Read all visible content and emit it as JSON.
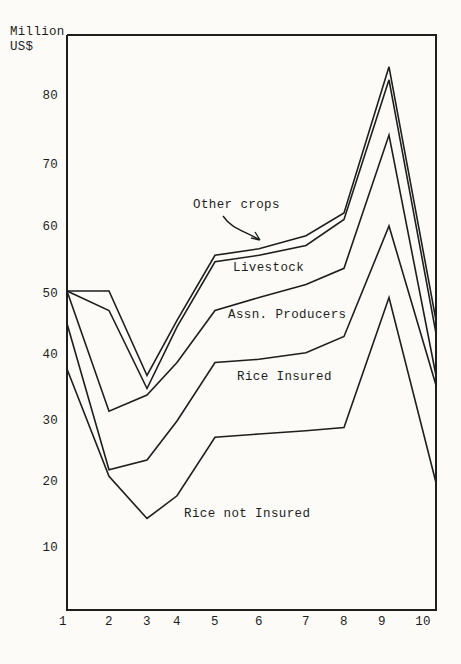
{
  "page": {
    "background_color": "#fcfbf8",
    "ink_color": "#1e1e1e"
  },
  "chart_data": {
    "type": "line",
    "title": "",
    "ylabel": "Million\nUS$",
    "xlabel": "",
    "categories": [
      "1",
      "2",
      "3",
      "4",
      "5",
      "6",
      "7",
      "8",
      "9",
      "10"
    ],
    "y_tick_labels": [
      "80",
      "70",
      "60",
      "50",
      "40",
      "30",
      "20",
      "10"
    ],
    "ylim": [
      0,
      88
    ],
    "grid": false,
    "legend_position": "inline-band-labels",
    "series": [
      {
        "name": "Other crops (top cumulative line)",
        "values": [
          50,
          50,
          37,
          45.5,
          55.5,
          56.5,
          58.5,
          62,
          84.5,
          45.5
        ]
      },
      {
        "name": "Livestock (cumulative)",
        "values": [
          50,
          47,
          35,
          44.5,
          54.5,
          55.5,
          57,
          61,
          82.5,
          43.5
        ]
      },
      {
        "name": "Assn. Producers (cumulative)",
        "values": [
          50,
          31.5,
          34,
          39,
          47,
          49,
          51,
          53.5,
          74,
          37
        ]
      },
      {
        "name": "Rice Insured (cumulative)",
        "values": [
          45,
          22.5,
          24,
          30,
          39,
          39.5,
          40.5,
          43,
          60,
          35.5
        ]
      },
      {
        "name": "Rice not Insured",
        "values": [
          38,
          21.5,
          15,
          18.5,
          27.5,
          28,
          28.5,
          29,
          49,
          20.5
        ]
      }
    ],
    "band_labels": [
      {
        "text": "Other crops",
        "x": 193,
        "y": 198
      },
      {
        "text": "Livestock",
        "x": 233,
        "y": 261
      },
      {
        "text": "Assn. Producers",
        "x": 228,
        "y": 308
      },
      {
        "text": "Rice Insured",
        "x": 237,
        "y": 370
      },
      {
        "text": "Rice not Insured",
        "x": 184,
        "y": 507
      }
    ],
    "layout_hints": {
      "frame_px": {
        "left": 67,
        "top": 35,
        "right": 436,
        "bottom": 610
      },
      "x_anchor_px": [
        67,
        109,
        147,
        177,
        215,
        259,
        306,
        344,
        389,
        436
      ],
      "x_tick_label_px": [
        63,
        109,
        147,
        177,
        215,
        259,
        306,
        344,
        382,
        423
      ],
      "y_tick_px": [
        96,
        165,
        227,
        294,
        355,
        421,
        482,
        548
      ],
      "y_scale": {
        "value_at": 10,
        "y_px": 551,
        "px_per_unit": 6.5
      },
      "arrow": {
        "from": [
          223,
          216
        ],
        "to": [
          260,
          240
        ]
      }
    }
  }
}
